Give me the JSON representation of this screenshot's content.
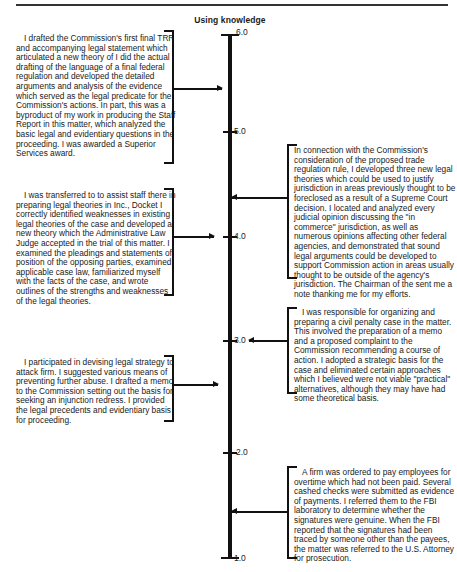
{
  "title": "Using knowledge",
  "axis": {
    "ticks": [
      {
        "label": "6.0",
        "value": 6.0
      },
      {
        "label": "5.0",
        "value": 5.0
      },
      {
        "label": "4.0",
        "value": 4.0
      },
      {
        "label": "3.0",
        "value": 3.0
      },
      {
        "label": "2.0",
        "value": 2.0
      },
      {
        "label": "1.0",
        "value": 1.0
      }
    ]
  },
  "anchors": {
    "left": [
      {
        "text": "I drafted the Commission's first final TRR and accompanying legal statement which articulated a new theory of I did the actual drafting of the language of a final federal regulation and developed the detailed arguments and analysis of the evidence which served as the legal predicate for the Commission's actions. In part, this was a byproduct of my work in producing the Staff Report in this matter, which analyzed the basic legal and evidentiary questions in the proceeding. I was awarded a Superior Services award.",
        "value": 5.6
      },
      {
        "text": "I was transferred to to assist staff there in preparing legal theories in Inc., Docket I correctly identified weaknesses in existing legal theories of the case and developed a new theory which the Administrative Law Judge accepted in the trial of this matter. I examined the pleadings and statements of position of the opposing parties, examined applicable case law, familiarized myself with the facts of the case, and wrote outlines of the strengths and weaknesses of the legal theories.",
        "value": 4.0
      },
      {
        "text": "I participated in devising legal strategy to attack firm. I suggested various means of preventing further abuse. I drafted a memo to the Commission setting out the basis for seeking an injunction redress. I provided the legal precedents and evidentiary basis for proceeding.",
        "value": 2.7
      }
    ],
    "right": [
      {
        "text": "In connection with the Commission's consideration of the proposed trade regulation rule, I developed three new legal theories which could be used to justify jurisdiction in areas previously thought to be foreclosed as a result of a Supreme Court decision. I located and analyzed every judicial opinion discussing the \"in commerce\" jurisdiction, as well as numerous opinions affecting other federal agencies, and demonstrated that sound legal arguments could be developed to support Commission action in areas usually thought to be outside of the agency's jurisdiction. The Chairman of the sent me a note thanking me for my efforts.",
        "value": 4.6
      },
      {
        "text": "I was responsible for organizing and preparing a civil penalty case in the matter. This involved the preparation of a memo and a proposed complaint to the Commission recommending a course of action. I adopted a strategic basis for the case and eliminated certain approaches which I believed were not viable \"practical\" alternatives, although they may have had some theoretical basis.",
        "value": 3.0
      },
      {
        "text": "A firm was ordered to pay employees for overtime which had not been paid. Several cashed checks were submitted as evidence of payments. I referred them to the FBI laboratory to determine whether the signatures were genuine. When the FBI reported that the signatures had been traced by someone other than the payees, the matter was referred to the U.S. Attorney for prosecution.",
        "value": 1.4
      }
    ]
  }
}
